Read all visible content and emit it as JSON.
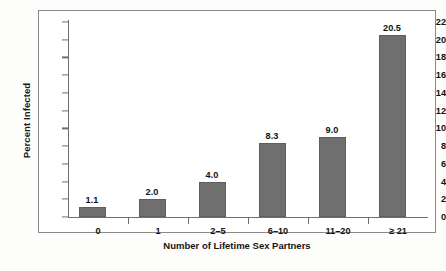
{
  "chart_data": {
    "type": "bar",
    "title": "",
    "xlabel": "Number of Lifetime Sex Partners",
    "ylabel": "Percent Infected",
    "categories": [
      "0",
      "1",
      "2–5",
      "6–10",
      "11–20",
      "≥ 21"
    ],
    "values": [
      1.1,
      2.0,
      4.0,
      8.3,
      9.0,
      20.5
    ],
    "data_labels": [
      "1.1",
      "2.0",
      "4.0",
      "8.3",
      "9.0",
      "20.5"
    ],
    "ylim": [
      0,
      22
    ],
    "ytick_labels": [
      "0",
      "2",
      "4",
      "6",
      "8",
      "10",
      "12",
      "14",
      "16",
      "18",
      "20",
      "22"
    ],
    "ytick_values": [
      0,
      2,
      4,
      6,
      8,
      10,
      12,
      14,
      16,
      18,
      20,
      22
    ],
    "grid": "off",
    "legend": "none",
    "bar_color": "#6f6f6f",
    "axis_color": "#6f6f6f",
    "frame_color": "#8a8a8a",
    "background_color": "#ffffff"
  }
}
